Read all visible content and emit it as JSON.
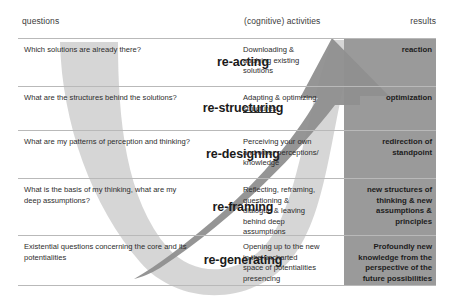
{
  "headers": {
    "questions": "questions",
    "activities": "(cognitive) activities",
    "results": "results"
  },
  "colors": {
    "page_background": "#ffffff",
    "u_band": "#c9c9c9",
    "u_band_light": "#d9d9d9",
    "arrow_body": "#9c9c9c",
    "results_column": "#9a9a9a",
    "row_divider": "#b9b9b9",
    "text": "#2d2d2d",
    "header_text": "#3b3b3b"
  },
  "rows": [
    {
      "question": "Which solutions are already there?",
      "term": "re-acting",
      "activity_lines": [
        {
          "text": "Downloading &",
          "underline": false
        },
        {
          "text": "applying existing",
          "underline": false
        },
        {
          "text": "solutions",
          "underline": false
        }
      ],
      "result": "reaction"
    },
    {
      "question": "What are the structures behind the solutions?",
      "term": "re-structuring",
      "activity_lines": [
        {
          "text": "Adapting & optimizing",
          "underline": false
        },
        {
          "text": "structures",
          "underline": true
        }
      ],
      "result": "optimization"
    },
    {
      "question": "What are my patterns of perception and thinking?",
      "term": "re-designing",
      "activity_lines": [
        {
          "text": "Perceiving your own",
          "underline": false
        },
        {
          "text": "and other perceptions/",
          "underline": false
        },
        {
          "text": "knowledge",
          "underline": false
        }
      ],
      "result": "redirection of standpoint"
    },
    {
      "question": "What is the basis of my thinking, what are my deep assumptions?",
      "term": "re-framing",
      "activity_lines": [
        {
          "text": "Reflecting, reframing,",
          "underline": false
        },
        {
          "text": "questioning &",
          "underline": false
        },
        {
          "text": "dialogue & leaving",
          "underline": false
        },
        {
          "text": "behind deep",
          "underline": false
        },
        {
          "text": "assumptions",
          "underline": false
        }
      ],
      "result": "new structures of thinking & new assumptions & principles"
    },
    {
      "question": "Existential questions concerning the core and its potentialities",
      "term": "re-generating",
      "activity_lines": [
        {
          "text": "Opening up to the new",
          "underline": false
        },
        {
          "text": "in the uncharted",
          "underline": false
        },
        {
          "text": "space of potentialities",
          "underline": false
        },
        {
          "text": "presencing",
          "underline": false
        }
      ],
      "result": "Profoundly new knowledge from the perspective of the future possibilities"
    }
  ],
  "graphics": {
    "u_shape_name": "u-process-descending-band",
    "arrow_name": "ascending-arrow",
    "results_block_name": "results-column-block"
  }
}
